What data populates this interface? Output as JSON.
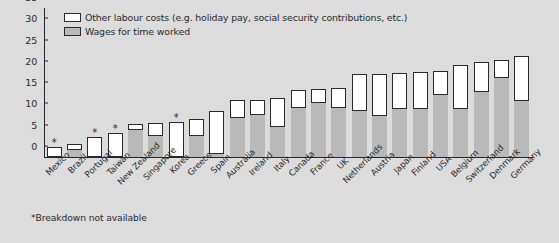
{
  "chart_data": {
    "type": "bar",
    "title": "",
    "subtitle": "",
    "xlabel": "",
    "ylabel": "",
    "ylim": [
      0,
      35
    ],
    "yticks": [
      0,
      5,
      10,
      15,
      20,
      25,
      30,
      35
    ],
    "grid": false,
    "stacked": true,
    "legend_position": "top-left",
    "legend": [
      {
        "key": "other",
        "label": "Other labour costs (e.g. holiday pay, social security contributions, etc.)",
        "color": "#ffffff"
      },
      {
        "key": "wages",
        "label": "Wages for time worked",
        "color": "#b9b9b9"
      }
    ],
    "categories": [
      "Mexico",
      "Brazil",
      "Portugal",
      "Taiwan",
      "New Zealand",
      "Singapore",
      "Korea",
      "Greece",
      "Spain",
      "Australia",
      "Ireland",
      "Italy",
      "Canada",
      "France",
      "UK",
      "Netherlands",
      "Austria",
      "Japan",
      "Finland",
      "USA",
      "Belgium",
      "Switzerland",
      "Denmark",
      "Germany"
    ],
    "series": [
      {
        "name": "Wages for time worked",
        "values": [
          null,
          1.9,
          null,
          null,
          6.5,
          5.2,
          null,
          5.2,
          0.9,
          9.3,
          10.2,
          7.2,
          11.7,
          13.0,
          11.7,
          11.0,
          9.9,
          11.5,
          11.5,
          14.7,
          11.5,
          15.5,
          18.8,
          13.5
        ]
      },
      {
        "name": "Other labour costs",
        "values": [
          null,
          1.2,
          null,
          null,
          1.3,
          2.8,
          null,
          3.8,
          10.0,
          4.0,
          3.2,
          6.7,
          4.0,
          3.0,
          4.5,
          8.4,
          9.6,
          8.2,
          8.5,
          5.6,
          10.0,
          6.8,
          4.0,
          10.3
        ]
      }
    ],
    "totals": [
      2.4,
      3.1,
      4.8,
      5.7,
      7.8,
      8.0,
      8.2,
      9.0,
      10.9,
      13.3,
      13.4,
      13.9,
      15.7,
      16.0,
      16.2,
      19.4,
      19.5,
      19.7,
      20.0,
      20.3,
      21.5,
      22.3,
      22.8,
      23.8
    ],
    "breakdown_unavailable": [
      "Mexico",
      "Portugal",
      "Taiwan",
      "Korea"
    ],
    "annotations": [
      "*Breakdown not available"
    ]
  },
  "footnote": "*Breakdown not available"
}
